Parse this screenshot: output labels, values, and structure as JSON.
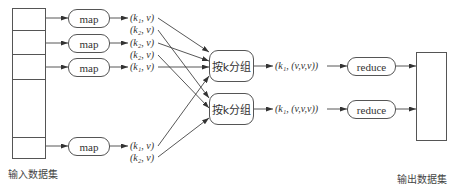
{
  "input": {
    "caption": "输入数据集",
    "rows": 5
  },
  "output": {
    "caption": "输出数据集"
  },
  "map_nodes": [
    {
      "label": "map",
      "outputs": [
        "(k₁, v)",
        "(k₂, v)"
      ]
    },
    {
      "label": "map",
      "outputs": [
        "(k₂, v)",
        "(k₂, v)"
      ]
    },
    {
      "label": "map",
      "outputs": [
        "(k₁, v)"
      ]
    },
    {
      "label": "map",
      "outputs": [
        "(k₁, v)",
        "(k₂, v)"
      ]
    }
  ],
  "group_nodes": [
    {
      "label": "按k分组",
      "output": "(k₁, (v,v,v))"
    },
    {
      "label": "按k分组",
      "output": "(k₁, (v,v,v))"
    }
  ],
  "reduce_nodes": [
    {
      "label": "reduce"
    },
    {
      "label": "reduce"
    }
  ]
}
